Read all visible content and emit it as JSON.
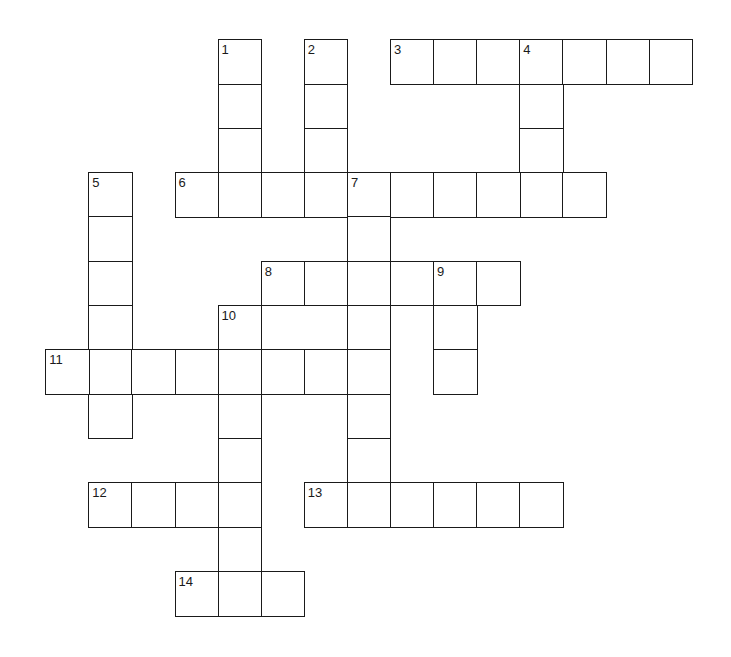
{
  "puzzle": {
    "type": "crossword",
    "layout": {
      "origin_x": 46,
      "origin_y": 40,
      "cell_width": 43.1,
      "cell_height": 44.3
    },
    "colors": {
      "line": "#1a1a1a",
      "cell_fill": "#ffffff",
      "background": "#ffffff"
    },
    "words": [
      {
        "number": "1",
        "direction": "down",
        "row": 0,
        "col": 4,
        "length": 4
      },
      {
        "number": "2",
        "direction": "down",
        "row": 0,
        "col": 6,
        "length": 4
      },
      {
        "number": "3",
        "direction": "across",
        "row": 0,
        "col": 8,
        "length": 7
      },
      {
        "number": "4",
        "direction": "down",
        "row": 0,
        "col": 11,
        "length": 4
      },
      {
        "number": "5",
        "direction": "down",
        "row": 3,
        "col": 1,
        "length": 6
      },
      {
        "number": "6",
        "direction": "across",
        "row": 3,
        "col": 3,
        "length": 10
      },
      {
        "number": "7",
        "direction": "down",
        "row": 3,
        "col": 7,
        "length": 8
      },
      {
        "number": "8",
        "direction": "across",
        "row": 5,
        "col": 5,
        "length": 6
      },
      {
        "number": "9",
        "direction": "down",
        "row": 5,
        "col": 9,
        "length": 3
      },
      {
        "number": "10",
        "direction": "down",
        "row": 6,
        "col": 4,
        "length": 7
      },
      {
        "number": "11",
        "direction": "across",
        "row": 7,
        "col": 0,
        "length": 8
      },
      {
        "number": "12",
        "direction": "across",
        "row": 10,
        "col": 1,
        "length": 4
      },
      {
        "number": "13",
        "direction": "across",
        "row": 10,
        "col": 6,
        "length": 6
      },
      {
        "number": "14",
        "direction": "across",
        "row": 12,
        "col": 3,
        "length": 3
      }
    ]
  }
}
